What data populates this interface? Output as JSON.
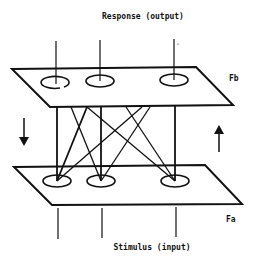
{
  "diagram": {
    "title_top": "Response (output)",
    "title_bottom": "Stimulus (input)",
    "layers": {
      "top": {
        "label": "Fb",
        "nodes": [
          {
            "cx": 56,
            "cy": 81
          },
          {
            "cx": 100,
            "cy": 81
          },
          {
            "cx": 174,
            "cy": 80
          }
        ]
      },
      "bottom": {
        "label": "Fa",
        "nodes": [
          {
            "cx": 57,
            "cy": 181
          },
          {
            "cx": 101,
            "cy": 181
          },
          {
            "cx": 175,
            "cy": 181
          }
        ]
      }
    },
    "arrows": {
      "left": "down",
      "right": "up"
    },
    "colors": {
      "stroke": "#111111",
      "background": "#ffffff"
    }
  }
}
